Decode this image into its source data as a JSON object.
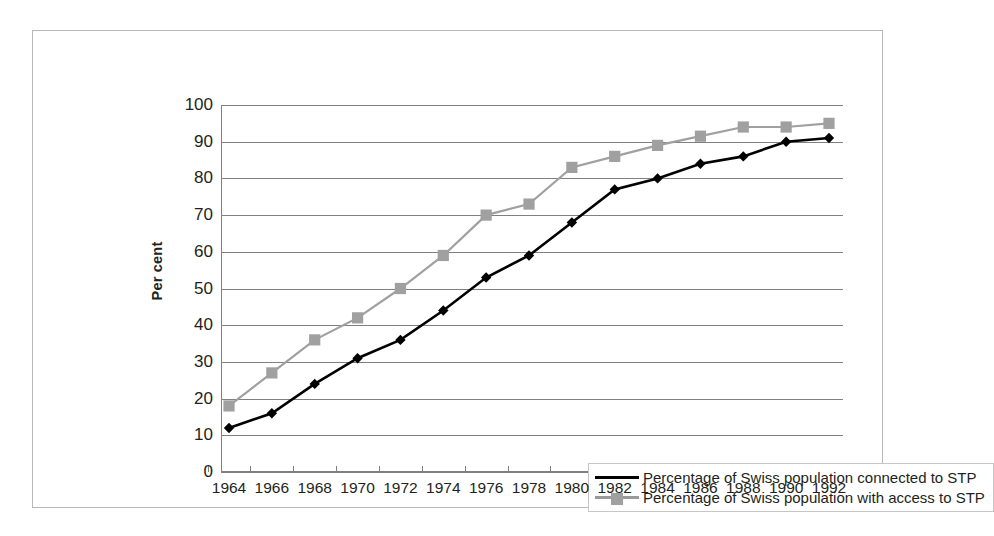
{
  "chart_data": {
    "type": "line",
    "title": "",
    "xlabel": "",
    "ylabel": "Per cent",
    "ylim": [
      0,
      100
    ],
    "ytick_step": 10,
    "yticks": [
      "100",
      "90",
      "80",
      "70",
      "60",
      "50",
      "40",
      "30",
      "20",
      "10",
      "0"
    ],
    "grid": true,
    "legend_position": "inside-center-lower",
    "categories": [
      "1964",
      "1966",
      "1968",
      "1970",
      "1972",
      "1974",
      "1976",
      "1978",
      "1980",
      "1982",
      "1984",
      "1986",
      "1988",
      "1990",
      "1992"
    ],
    "series": [
      {
        "name": "Percentage of Swiss population connected to STP",
        "color": "#000000",
        "marker": "diamond",
        "values": [
          12,
          16,
          24,
          31,
          36,
          44,
          53,
          59,
          68,
          77,
          80,
          84,
          86,
          90,
          91
        ]
      },
      {
        "name": "Percentage of Swiss population with access to STP",
        "color": "#a0a0a0",
        "marker": "square",
        "values": [
          18,
          27,
          36,
          42,
          50,
          59,
          70,
          73,
          83,
          86,
          89,
          91.5,
          94,
          94,
          95
        ]
      }
    ]
  },
  "legend": {
    "items": [
      {
        "label": "Percentage of Swiss population connected to STP",
        "marker": "diamond-marker",
        "color": "#000000"
      },
      {
        "label": "Percentage of Swiss population with access to STP",
        "marker": "square-marker",
        "color": "#a0a0a0"
      }
    ]
  },
  "colors": {
    "series_connected": "#000000",
    "series_access": "#a0a0a0",
    "gridline": "#808080",
    "frame_border": "#b9b9b9",
    "text": "#231f20"
  }
}
